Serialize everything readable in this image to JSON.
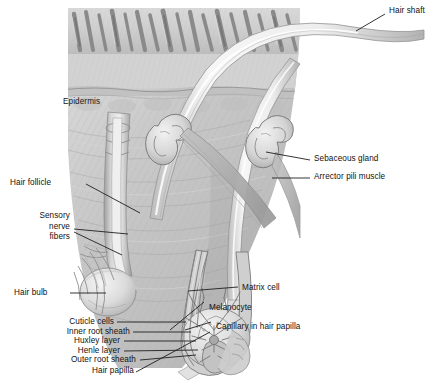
{
  "figure": {
    "style": "grayscale medical illustration",
    "colors": {
      "background": "#ffffff",
      "text": "#111111",
      "leader_line": "#2a2a2a",
      "skin_light": "#e9e9e9",
      "skin_mid": "#c9c9c9",
      "skin_dark": "#9a9a9a",
      "hair_shaft": "#f2f2f2",
      "hair_stub": "#8d8d8d",
      "follicle_outline": "#707070",
      "papilla": "#b5b5b5"
    }
  },
  "labels": {
    "hair_shaft": "Hair shaft",
    "epidermis": "Epidermis",
    "sebaceous_gland": "Sebaceous gland",
    "arrector_pili_muscle": "Arrector pili muscle",
    "hair_follicle": "Hair follicle",
    "sensory_nerve_fibers": "Sensory\nnerve\nfibers",
    "sensory_nerve_fibers_flat": "Sensory nerve fibers",
    "hair_bulb": "Hair bulb",
    "matrix_cell": "Matrix cell",
    "melanocyte": "Melanocyte",
    "capillary_in_hair_papilla": "Capillary in hair papilla",
    "cuticle_cells": "Cuticle cells",
    "inner_root_sheath": "Inner root sheath",
    "huxley_layer": "Huxley layer",
    "henle_layer": "Henle layer",
    "outer_root_sheath": "Outer root sheath",
    "hair_papilla": "Hair papilla"
  }
}
